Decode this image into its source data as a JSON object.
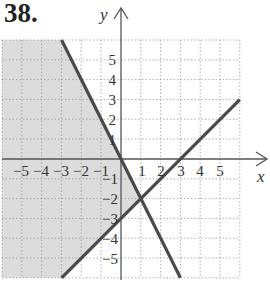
{
  "problem": {
    "number": "38."
  },
  "axes": {
    "x_label": "x",
    "y_label": "y",
    "x_range": [
      -6,
      6
    ],
    "y_range": [
      -6,
      6
    ],
    "x_ticks": [
      "−5",
      "−4",
      "−3",
      "−2",
      "−1",
      "1",
      "2",
      "3",
      "4",
      "5"
    ],
    "y_ticks_positive": [
      "5",
      "4",
      "3",
      "2",
      "1"
    ],
    "y_ticks_negative": [
      "−1",
      "−2",
      "−3",
      "−4",
      "−5"
    ]
  },
  "lines": [
    {
      "name": "boundary-y-eq-neg2x",
      "equation": "y = -2x",
      "from": [
        -3,
        6
      ],
      "to": [
        3,
        -6
      ]
    },
    {
      "name": "boundary-y-eq-x-minus-3",
      "equation": "y = x - 3",
      "from": [
        -3,
        -6
      ],
      "to": [
        6,
        3
      ]
    }
  ],
  "shaded_region": {
    "description": "y ≤ -2x and y ≥ x - 3",
    "vertex": [
      1,
      -2
    ]
  },
  "colors": {
    "shade": "#dcdcdc",
    "line": "#4a4a4a",
    "grid": "#9a9a9a",
    "axis": "#555555"
  }
}
